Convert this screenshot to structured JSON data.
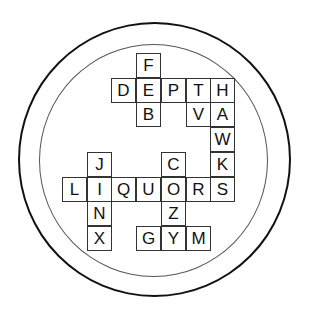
{
  "puzzle": {
    "type": "crossword",
    "shape": "circle",
    "cell_size_px": 24.7,
    "columns": 7,
    "rows": 8,
    "colors": {
      "background": "#ffffff",
      "outer_ring": "#111111",
      "inner_ring": "#555555",
      "cell_border": "#333333",
      "letter": "#111111"
    },
    "words": {
      "across": [
        "DEPTH",
        "LIQUORS",
        "GYM"
      ],
      "down": [
        "FEB",
        "TV",
        "HAWKS",
        "JINX",
        "COZY"
      ]
    },
    "cells": [
      {
        "row": 0,
        "col": 3,
        "letter": "F"
      },
      {
        "row": 1,
        "col": 2,
        "letter": "D"
      },
      {
        "row": 1,
        "col": 3,
        "letter": "E"
      },
      {
        "row": 1,
        "col": 4,
        "letter": "P"
      },
      {
        "row": 1,
        "col": 5,
        "letter": "T"
      },
      {
        "row": 1,
        "col": 6,
        "letter": "H"
      },
      {
        "row": 2,
        "col": 3,
        "letter": "B"
      },
      {
        "row": 2,
        "col": 5,
        "letter": "V"
      },
      {
        "row": 2,
        "col": 6,
        "letter": "A"
      },
      {
        "row": 3,
        "col": 6,
        "letter": "W"
      },
      {
        "row": 4,
        "col": 1,
        "letter": "J"
      },
      {
        "row": 4,
        "col": 4,
        "letter": "C"
      },
      {
        "row": 4,
        "col": 6,
        "letter": "K"
      },
      {
        "row": 5,
        "col": 0,
        "letter": "L"
      },
      {
        "row": 5,
        "col": 1,
        "letter": "I"
      },
      {
        "row": 5,
        "col": 2,
        "letter": "Q"
      },
      {
        "row": 5,
        "col": 3,
        "letter": "U"
      },
      {
        "row": 5,
        "col": 4,
        "letter": "O"
      },
      {
        "row": 5,
        "col": 5,
        "letter": "R"
      },
      {
        "row": 5,
        "col": 6,
        "letter": "S"
      },
      {
        "row": 6,
        "col": 1,
        "letter": "N"
      },
      {
        "row": 6,
        "col": 4,
        "letter": "Z"
      },
      {
        "row": 7,
        "col": 1,
        "letter": "X"
      },
      {
        "row": 7,
        "col": 3,
        "letter": "G"
      },
      {
        "row": 7,
        "col": 4,
        "letter": "Y"
      },
      {
        "row": 7,
        "col": 5,
        "letter": "M"
      }
    ]
  }
}
